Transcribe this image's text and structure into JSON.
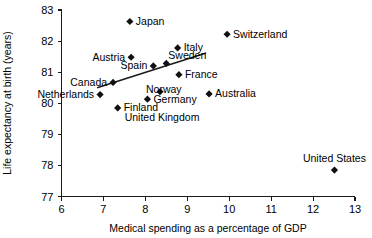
{
  "chart_data": {
    "type": "scatter",
    "title": "",
    "xlabel": "Medical spending as a percentage of GDP",
    "ylabel": "Life expectancy at birth (years)",
    "xlim": [
      6,
      13
    ],
    "ylim": [
      77,
      83
    ],
    "xticks": [
      "6",
      "7",
      "8",
      "9",
      "10",
      "11",
      "12",
      "13"
    ],
    "yticks": [
      "77",
      "78",
      "79",
      "80",
      "81",
      "82",
      "83"
    ],
    "grid": false,
    "legend": "none",
    "marker_shape": "diamond",
    "marker_color": "#111111",
    "trendline": {
      "label": "linear fit",
      "color": "#1a1a1a",
      "x_start": 6.85,
      "y_start": 80.5,
      "x_end": 9.45,
      "y_end": 81.62
    },
    "points": [
      {
        "label": "Japan",
        "x": 7.63,
        "y": 82.63,
        "label_pos": "right"
      },
      {
        "label": "Switzerland",
        "x": 9.95,
        "y": 82.22,
        "label_pos": "right"
      },
      {
        "label": "Italy",
        "x": 8.77,
        "y": 81.78,
        "label_pos": "right"
      },
      {
        "label": "Austria",
        "x": 7.66,
        "y": 81.48,
        "label_pos": "left"
      },
      {
        "label": "Sweden",
        "x": 8.5,
        "y": 81.28,
        "label_pos": "right-above"
      },
      {
        "label": "Spain",
        "x": 8.19,
        "y": 81.2,
        "label_pos": "left"
      },
      {
        "label": "France",
        "x": 8.8,
        "y": 80.92,
        "label_pos": "right"
      },
      {
        "label": "Canada",
        "x": 7.23,
        "y": 80.67,
        "label_pos": "left"
      },
      {
        "label": "Norway",
        "x": 8.35,
        "y": 80.37,
        "label_pos": "right-below"
      },
      {
        "label": "Australia",
        "x": 9.52,
        "y": 80.3,
        "label_pos": "right"
      },
      {
        "label": "Netherlands",
        "x": 6.92,
        "y": 80.28,
        "label_pos": "left"
      },
      {
        "label": "Germany",
        "x": 8.05,
        "y": 80.13,
        "label_pos": "right"
      },
      {
        "label": "Finland",
        "x": 7.34,
        "y": 79.85,
        "label_pos": "right"
      },
      {
        "label": "United Kingdom",
        "x": 7.34,
        "y": 79.85,
        "label_pos": "right-below2"
      },
      {
        "label": "United States",
        "x": 12.51,
        "y": 77.85,
        "label_pos": "above"
      }
    ]
  },
  "axes": {
    "x_title": "Medical spending as a percentage of GDP",
    "y_title": "Life expectancy at birth (years)"
  }
}
